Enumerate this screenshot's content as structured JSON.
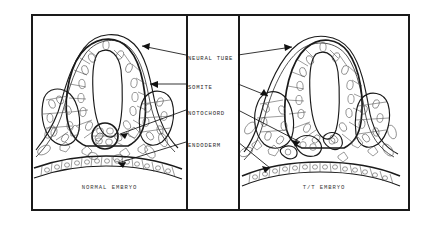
{
  "figure": {
    "type": "scientific-line-drawing",
    "background_color": "#ffffff",
    "ink_color": "#1a1a1a"
  },
  "panels": [
    {
      "id": "normal",
      "caption": "NORMAL EMBRYO"
    },
    {
      "id": "mutant",
      "caption": "T/T EMBRYO"
    }
  ],
  "labels": [
    {
      "key": "neural_tube",
      "text": "NEURAL TUBE"
    },
    {
      "key": "somite",
      "text": "SOMITE"
    },
    {
      "key": "notochord",
      "text": "NOTOCHORD"
    },
    {
      "key": "endoderm",
      "text": "ENDODERM"
    }
  ],
  "annotations": {
    "leader_style": "arrow-terminated straight lines from central label column into both panels",
    "arrow_fill": "#111111"
  }
}
